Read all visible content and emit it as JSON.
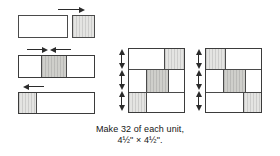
{
  "figure": {
    "kind": "quilt-block-assembly-diagram",
    "caption": {
      "line1": "Make 32 of each unit,",
      "line2": "4½\" × 4½\"."
    },
    "colors": {
      "light": "#ffffff",
      "medium": "#e4e4e2",
      "dark": "#cfcfcb",
      "outline": "#4a4a4a",
      "arrow": "#2b2b2b",
      "text": "#141414",
      "background": "#ffffff"
    }
  },
  "steps": [
    {
      "id": "step-1",
      "name": "join-light-rectangle-to-medium-square",
      "pieces": [
        {
          "name": "light-rectangle",
          "fabric": "light"
        },
        {
          "name": "medium-square",
          "fabric": "medium"
        }
      ],
      "arrows": [
        {
          "name": "press-arrow-right",
          "direction": "right"
        }
      ]
    },
    {
      "id": "step-2",
      "name": "three-patch-strip-light-medium-light",
      "pieces": [
        {
          "name": "light-end-patch",
          "fabric": "light"
        },
        {
          "name": "medium-center-patch",
          "fabric": "dark"
        },
        {
          "name": "light-end-patch",
          "fabric": "light"
        }
      ],
      "arrows": [
        {
          "name": "press-arrow-right",
          "direction": "right"
        },
        {
          "name": "press-arrow-left",
          "direction": "left"
        }
      ]
    },
    {
      "id": "step-3",
      "name": "join-medium-strip-to-light-rectangle",
      "pieces": [
        {
          "name": "medium-narrow-strip",
          "fabric": "medium"
        },
        {
          "name": "light-rectangle",
          "fabric": "light"
        }
      ],
      "arrows": [
        {
          "name": "press-arrow-left",
          "direction": "left"
        }
      ]
    }
  ],
  "units": [
    {
      "id": "unit-a",
      "name": "finished-unit-a",
      "grid": [
        [
          "light",
          "light",
          "medium"
        ],
        [
          "light",
          "dark",
          "light"
        ],
        [
          "medium",
          "light",
          "light"
        ]
      ],
      "seam_arrows": 3
    },
    {
      "id": "unit-b",
      "name": "finished-unit-b",
      "grid": [
        [
          "medium",
          "light",
          "light"
        ],
        [
          "light",
          "dark",
          "light"
        ],
        [
          "light",
          "light",
          "medium"
        ]
      ],
      "seam_arrows": 3
    }
  ]
}
